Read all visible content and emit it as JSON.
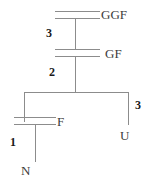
{
  "diagram": {
    "type": "genealogy-pedigree",
    "line_color": "#8c8c8c",
    "label_color": "#3b3b3b",
    "number_color": "#1a1a1a",
    "persons": [
      {
        "id": "ggf",
        "label": "GGF",
        "meaning": "great-grandfather",
        "generation": 0
      },
      {
        "id": "gf",
        "label": "GF",
        "meaning": "grandfather",
        "generation": 1
      },
      {
        "id": "f",
        "label": "F",
        "meaning": "father",
        "generation": 2
      },
      {
        "id": "u",
        "label": "U",
        "meaning": "uncle",
        "generation": 2
      },
      {
        "id": "n",
        "label": "N",
        "meaning": "nephew/self",
        "generation": 3
      }
    ],
    "edge_numbers": [
      {
        "id": "edge-ggf-gf",
        "value": "3",
        "from": "ggf",
        "to": "gf"
      },
      {
        "id": "edge-gf-f",
        "value": "2",
        "from": "gf",
        "to": "f"
      },
      {
        "id": "edge-sib-u",
        "value": "3",
        "from": "gf",
        "to": "u"
      },
      {
        "id": "edge-f-n",
        "value": "1",
        "from": "f",
        "to": "n"
      }
    ],
    "marriage_symbols": [
      {
        "id": "marriage-ggf"
      },
      {
        "id": "marriage-gf"
      },
      {
        "id": "marriage-f"
      }
    ]
  }
}
